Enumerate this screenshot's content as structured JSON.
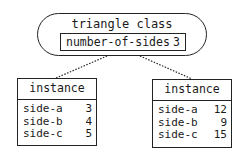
{
  "class_node": {
    "title": "triangle class",
    "attribute": {
      "name": "number-of-sides",
      "value": "3"
    }
  },
  "instances": [
    {
      "title": "instance",
      "slots": [
        {
          "name": "side-a",
          "value": "3"
        },
        {
          "name": "side-b",
          "value": "4"
        },
        {
          "name": "side-c",
          "value": "5"
        }
      ]
    },
    {
      "title": "instance",
      "slots": [
        {
          "name": "side-a",
          "value": "12"
        },
        {
          "name": "side-b",
          "value": "9"
        },
        {
          "name": "side-c",
          "value": "15"
        }
      ]
    }
  ],
  "edges": [
    {
      "from": "triangle class",
      "to": "instance 1",
      "style": "dotted"
    },
    {
      "from": "triangle class",
      "to": "instance 2",
      "style": "dotted"
    }
  ]
}
